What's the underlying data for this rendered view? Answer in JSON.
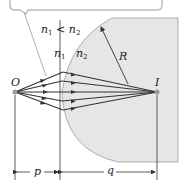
{
  "diagram": {
    "condition": {
      "n_left": "n",
      "sub_left": "1",
      "relation": "<",
      "n_right": "n",
      "sub_right": "2"
    },
    "medium_left": {
      "symbol": "n",
      "sub": "1"
    },
    "medium_right": {
      "symbol": "n",
      "sub": "2"
    },
    "radius_label": "R",
    "object_label": "O",
    "image_label": "I",
    "object_distance_label": "p",
    "image_distance_label": "q",
    "colors": {
      "glass": "#e6e6e8",
      "glass_edge": "#9a9a9a",
      "ray": "#333333",
      "point": "#9a9a9a"
    }
  }
}
